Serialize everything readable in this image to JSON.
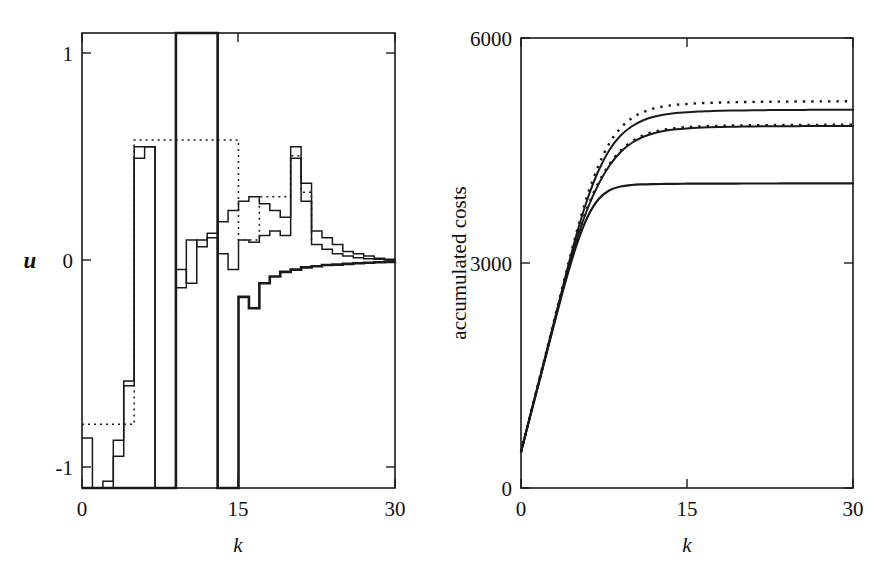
{
  "figure": {
    "background": "#ffffff",
    "foreground": "#1a1a1a",
    "width": 886,
    "height": 577
  },
  "chart_data": [
    {
      "id": "left-panel",
      "type": "line",
      "title": "",
      "subtitle": "",
      "xlabel": "k",
      "ylabel": "u",
      "xlim": [
        0,
        30
      ],
      "ylim": [
        -1,
        1
      ],
      "xticks": [
        0,
        15,
        30
      ],
      "xticklabels": [
        "0",
        "15",
        "30"
      ],
      "yticks": [
        -1,
        0,
        1
      ],
      "yticklabels": [
        "-1",
        "0",
        "1"
      ],
      "grid": false,
      "legend": "none",
      "drawstyle": "steps-post",
      "annotations": [],
      "series": [
        {
          "name": "bang-bang control (solid, thick)",
          "style": "solid",
          "linewidth": 2.6,
          "x": [
            0,
            1,
            2,
            3,
            4,
            5,
            6,
            7,
            8,
            9,
            10,
            11,
            12,
            13,
            14,
            15,
            16,
            17,
            18,
            19,
            20,
            21,
            22,
            23,
            24,
            25,
            26,
            27,
            28,
            29,
            30
          ],
          "values": [
            -1,
            -1,
            -1,
            -1,
            -1,
            -1,
            -1,
            -1,
            -1,
            1,
            1,
            1,
            1,
            -1,
            -1,
            -0.16,
            -0.21,
            -0.1,
            -0.07,
            -0.05,
            -0.04,
            -0.03,
            -0.025,
            -0.02,
            -0.018,
            -0.015,
            -0.012,
            -0.01,
            -0.008,
            -0.006,
            -0.005
          ]
        },
        {
          "name": "predictive control A (solid, thin)",
          "style": "solid",
          "linewidth": 1.5,
          "x": [
            0,
            1,
            2,
            3,
            4,
            5,
            6,
            7,
            8,
            9,
            10,
            11,
            12,
            13,
            14,
            15,
            16,
            17,
            18,
            19,
            20,
            21,
            22,
            23,
            24,
            25,
            26,
            27,
            28,
            29,
            30
          ],
          "values": [
            -0.78,
            -1,
            -0.97,
            -0.79,
            -0.53,
            0.5,
            0.5,
            -1,
            -1,
            -0.04,
            -0.1,
            0.09,
            0.12,
            0.17,
            0.22,
            0.26,
            0.28,
            0.25,
            0.22,
            0.19,
            0.5,
            0.34,
            0.13,
            0.1,
            0.07,
            0.04,
            0.03,
            0.02,
            0.01,
            0.005,
            0.0
          ]
        },
        {
          "name": "predictive control B (solid, thin)",
          "style": "solid",
          "linewidth": 1.5,
          "x": [
            0,
            1,
            2,
            3,
            4,
            5,
            6,
            7,
            8,
            9,
            10,
            11,
            12,
            13,
            14,
            15,
            16,
            17,
            18,
            19,
            20,
            21,
            22,
            23,
            24,
            25,
            26,
            27,
            28,
            29,
            30
          ],
          "values": [
            -1,
            -1,
            -1,
            -0.86,
            -0.55,
            0.45,
            0.5,
            -1,
            -1,
            -0.12,
            0.09,
            0.06,
            0.1,
            0.03,
            -0.04,
            0.09,
            0.08,
            0.11,
            0.13,
            0.11,
            0.45,
            0.26,
            0.07,
            0.05,
            0.03,
            0.02,
            0.012,
            0.008,
            0.005,
            0.003,
            0.0
          ]
        },
        {
          "name": "reference (dotted overlay)",
          "style": "dotted",
          "linewidth": 1.5,
          "x": [
            0,
            5,
            6,
            15,
            17,
            20,
            21,
            22
          ],
          "values": [
            -0.72,
            0.53,
            0.53,
            0.09,
            0.28,
            0.46,
            0.3,
            0.09
          ]
        }
      ]
    },
    {
      "id": "right-panel",
      "type": "line",
      "title": "",
      "subtitle": "",
      "xlabel": "k",
      "ylabel": "accumulated costs",
      "xlim": [
        0,
        30
      ],
      "ylim": [
        0,
        6000
      ],
      "xticks": [
        0,
        15,
        30
      ],
      "xticklabels": [
        "0",
        "15",
        "30"
      ],
      "yticks": [
        0,
        3000,
        6000
      ],
      "yticklabels": [
        "0",
        "3000",
        "6000"
      ],
      "grid": false,
      "legend": "none",
      "annotations": [],
      "series": [
        {
          "name": "costs upper (dotted)",
          "style": "dotted",
          "linewidth": 2.4,
          "x": [
            0,
            1,
            2,
            3,
            4,
            5,
            6,
            7,
            8,
            9,
            10,
            11,
            12,
            13,
            14,
            15,
            16,
            17,
            18,
            19,
            20,
            21,
            22,
            23,
            24,
            25,
            26,
            27,
            28,
            29,
            30
          ],
          "values": [
            480,
            1070,
            1650,
            2240,
            2830,
            3400,
            3900,
            4300,
            4600,
            4800,
            4930,
            5010,
            5060,
            5090,
            5110,
            5120,
            5130,
            5135,
            5140,
            5143,
            5146,
            5148,
            5150,
            5151,
            5152,
            5153,
            5154,
            5155,
            5155,
            5156,
            5156
          ]
        },
        {
          "name": "costs upper (solid)",
          "style": "solid",
          "linewidth": 2.0,
          "x": [
            0,
            1,
            2,
            3,
            4,
            5,
            6,
            7,
            8,
            9,
            10,
            11,
            12,
            13,
            14,
            15,
            16,
            17,
            18,
            19,
            20,
            21,
            22,
            23,
            24,
            25,
            26,
            27,
            28,
            29,
            30
          ],
          "values": [
            480,
            1065,
            1640,
            2225,
            2810,
            3370,
            3850,
            4230,
            4510,
            4700,
            4820,
            4900,
            4950,
            4980,
            5000,
            5010,
            5020,
            5025,
            5030,
            5033,
            5035,
            5037,
            5038,
            5039,
            5040,
            5041,
            5042,
            5042,
            5043,
            5043,
            5043
          ]
        },
        {
          "name": "costs middle (dotted)",
          "style": "dotted",
          "linewidth": 2.4,
          "x": [
            0,
            1,
            2,
            3,
            4,
            5,
            6,
            7,
            8,
            9,
            10,
            11,
            12,
            13,
            14,
            15,
            16,
            17,
            18,
            19,
            20,
            21,
            22,
            23,
            24,
            25,
            26,
            27,
            28,
            29,
            30
          ],
          "values": [
            480,
            1060,
            1630,
            2210,
            2780,
            3310,
            3740,
            4070,
            4320,
            4500,
            4620,
            4700,
            4750,
            4780,
            4800,
            4812,
            4820,
            4826,
            4830,
            4833,
            4835,
            4837,
            4838,
            4839,
            4840,
            4841,
            4842,
            4842,
            4843,
            4843,
            4843
          ]
        },
        {
          "name": "costs middle (solid)",
          "style": "solid",
          "linewidth": 2.0,
          "x": [
            0,
            1,
            2,
            3,
            4,
            5,
            6,
            7,
            8,
            9,
            10,
            11,
            12,
            13,
            14,
            15,
            16,
            17,
            18,
            19,
            20,
            21,
            22,
            23,
            24,
            25,
            26,
            27,
            28,
            29,
            30
          ],
          "values": [
            480,
            1058,
            1625,
            2200,
            2770,
            3295,
            3720,
            4050,
            4300,
            4480,
            4600,
            4680,
            4730,
            4762,
            4782,
            4795,
            4804,
            4810,
            4814,
            4817,
            4819,
            4821,
            4822,
            4823,
            4824,
            4825,
            4826,
            4826,
            4827,
            4827,
            4827
          ]
        },
        {
          "name": "costs lower (solid)",
          "style": "solid",
          "linewidth": 2.2,
          "x": [
            0,
            1,
            2,
            3,
            4,
            5,
            6,
            7,
            8,
            9,
            10,
            11,
            12,
            13,
            14,
            15,
            16,
            17,
            18,
            19,
            20,
            21,
            22,
            23,
            24,
            25,
            26,
            27,
            28,
            29,
            30
          ],
          "values": [
            480,
            1055,
            1620,
            2190,
            2740,
            3230,
            3610,
            3850,
            3970,
            4020,
            4040,
            4048,
            4052,
            4054,
            4056,
            4057,
            4058,
            4058,
            4059,
            4059,
            4060,
            4060,
            4060,
            4060,
            4061,
            4061,
            4061,
            4061,
            4061,
            4061,
            4061
          ]
        }
      ]
    }
  ]
}
